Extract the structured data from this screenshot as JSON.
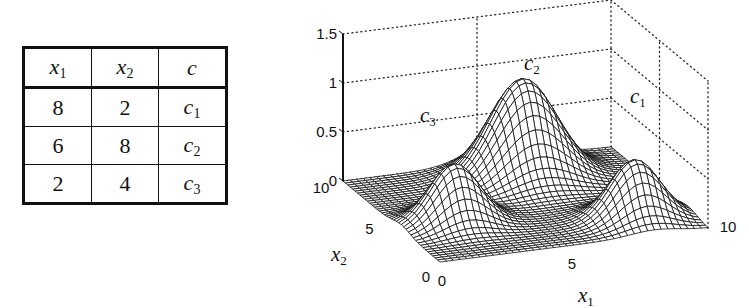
{
  "table": {
    "headers": [
      {
        "base": "x",
        "sub": "1"
      },
      {
        "base": "x",
        "sub": "2"
      },
      {
        "base": "c",
        "sub": ""
      }
    ],
    "rows": [
      {
        "x1": "8",
        "x2": "2",
        "c_base": "c",
        "c_sub": "1"
      },
      {
        "x1": "6",
        "x2": "8",
        "c_base": "c",
        "c_sub": "2"
      },
      {
        "x1": "2",
        "x2": "4",
        "c_base": "c",
        "c_sub": "3"
      }
    ]
  },
  "chart_data": {
    "type": "surface",
    "title": "",
    "xlabel": "x1",
    "ylabel": "x2",
    "zlabel": "",
    "xlim": [
      0,
      10
    ],
    "ylim": [
      0,
      10
    ],
    "zlim": [
      0,
      1.5
    ],
    "x_ticks": [
      "0",
      "5",
      "10"
    ],
    "y_ticks": [
      "0",
      "5",
      "10"
    ],
    "z_ticks": [
      "0",
      "0.5",
      "1",
      "1.5"
    ],
    "grid": true,
    "peaks": [
      {
        "label": "c1",
        "center": [
          8,
          2
        ],
        "height": 0.6,
        "sigma": 0.9
      },
      {
        "label": "c2",
        "center": [
          6,
          8
        ],
        "height": 1.0,
        "sigma": 1.2
      },
      {
        "label": "c3",
        "center": [
          2,
          4
        ],
        "height": 0.6,
        "sigma": 0.9
      }
    ],
    "mesh_resolution": 41,
    "annotations": [
      {
        "text": "c",
        "sub": "1",
        "near": "c1"
      },
      {
        "text": "c",
        "sub": "2",
        "near": "c2"
      },
      {
        "text": "c",
        "sub": "3",
        "near": "c3"
      }
    ]
  }
}
